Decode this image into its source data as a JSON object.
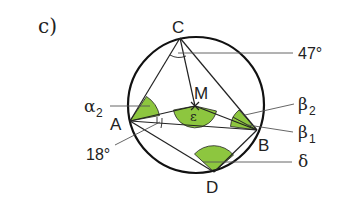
{
  "part_label": "c)",
  "points": {
    "A": {
      "label": "A",
      "x": 130,
      "y": 121
    },
    "B": {
      "label": "B",
      "x": 257,
      "y": 130
    },
    "C": {
      "label": "C",
      "x": 180,
      "y": 38
    },
    "D": {
      "label": "D",
      "x": 214,
      "y": 172
    },
    "M": {
      "label": "M",
      "x": 195,
      "y": 106
    }
  },
  "circle": {
    "cx": 196,
    "cy": 105,
    "r": 68
  },
  "angle_labels": {
    "c_angle": "47°",
    "a_angle": "18°",
    "alpha2": {
      "symbol": "α",
      "sub": "2"
    },
    "beta2": {
      "symbol": "β",
      "sub": "2"
    },
    "beta1": {
      "symbol": "β",
      "sub": "1"
    },
    "delta": {
      "symbol": "δ"
    },
    "epsilon": {
      "symbol": "ε"
    }
  },
  "colors": {
    "highlight": "#8dc63f",
    "stroke": "#222222"
  }
}
